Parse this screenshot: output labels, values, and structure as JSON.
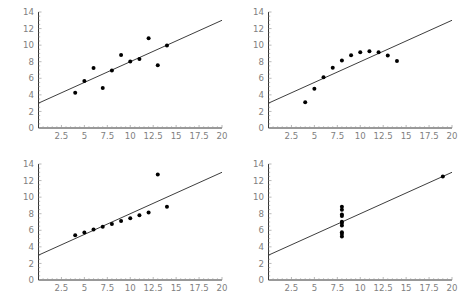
{
  "figure": {
    "title": "",
    "caption_fragment": ""
  },
  "chart_data": [
    {
      "type": "scatter",
      "title": "",
      "panel": "top-left",
      "xlabel": "",
      "ylabel": "",
      "xlim": [
        0,
        20
      ],
      "ylim": [
        0,
        14
      ],
      "xticks": [
        2.5,
        5,
        7.5,
        10,
        12.5,
        15,
        17.5,
        20
      ],
      "xtick_labels": [
        "2.5",
        "5",
        "7.5",
        "10",
        "12.5",
        "15",
        "17.5",
        "20"
      ],
      "yticks": [
        0,
        2,
        4,
        6,
        8,
        10,
        12,
        14
      ],
      "ytick_labels": [
        "0",
        "2",
        "4",
        "6",
        "8",
        "10",
        "12",
        "14"
      ],
      "grid": false,
      "legend": false,
      "x": [
        10,
        8,
        13,
        9,
        11,
        14,
        6,
        4,
        12,
        7,
        5
      ],
      "y": [
        8.04,
        6.95,
        7.58,
        8.81,
        8.33,
        9.96,
        7.24,
        4.26,
        10.84,
        4.82,
        5.68
      ],
      "fit_line": {
        "intercept": 3.0,
        "slope": 0.5,
        "x_start": 0,
        "x_end": 20,
        "y_start": 3.0,
        "y_end": 13.0
      }
    },
    {
      "type": "scatter",
      "title": "",
      "panel": "top-right",
      "xlabel": "",
      "ylabel": "",
      "xlim": [
        0,
        20
      ],
      "ylim": [
        0,
        14
      ],
      "xticks": [
        2.5,
        5,
        7.5,
        10,
        12.5,
        15,
        17.5,
        20
      ],
      "xtick_labels": [
        "2.5",
        "5",
        "7.5",
        "10",
        "12.5",
        "15",
        "17.5",
        "20"
      ],
      "yticks": [
        0,
        2,
        4,
        6,
        8,
        10,
        12,
        14
      ],
      "ytick_labels": [
        "0",
        "2",
        "4",
        "6",
        "8",
        "10",
        "12",
        "14"
      ],
      "grid": false,
      "legend": false,
      "x": [
        10,
        8,
        13,
        9,
        11,
        14,
        6,
        4,
        12,
        7,
        5
      ],
      "y": [
        9.14,
        8.14,
        8.74,
        8.77,
        9.26,
        8.1,
        6.13,
        3.1,
        9.13,
        7.26,
        4.74
      ],
      "fit_line": {
        "intercept": 3.0,
        "slope": 0.5,
        "x_start": 0,
        "x_end": 20,
        "y_start": 3.0,
        "y_end": 13.0
      }
    },
    {
      "type": "scatter",
      "title": "",
      "panel": "bottom-left",
      "xlabel": "",
      "ylabel": "",
      "xlim": [
        0,
        20
      ],
      "ylim": [
        0,
        14
      ],
      "xticks": [
        2.5,
        5,
        7.5,
        10,
        12.5,
        15,
        17.5,
        20
      ],
      "xtick_labels": [
        "2.5",
        "5",
        "7.5",
        "10",
        "12.5",
        "15",
        "17.5",
        "20"
      ],
      "yticks": [
        0,
        2,
        4,
        6,
        8,
        10,
        12,
        14
      ],
      "ytick_labels": [
        "0",
        "2",
        "4",
        "6",
        "8",
        "10",
        "12",
        "14"
      ],
      "grid": false,
      "legend": false,
      "x": [
        10,
        8,
        13,
        9,
        11,
        14,
        6,
        4,
        12,
        7,
        5
      ],
      "y": [
        7.46,
        6.77,
        12.74,
        7.11,
        7.81,
        8.84,
        6.08,
        5.39,
        8.15,
        6.42,
        5.73
      ],
      "fit_line": {
        "intercept": 3.0,
        "slope": 0.5,
        "x_start": 0,
        "x_end": 20,
        "y_start": 3.0,
        "y_end": 13.0
      }
    },
    {
      "type": "scatter",
      "title": "",
      "panel": "bottom-right",
      "xlabel": "",
      "ylabel": "",
      "xlim": [
        0,
        20
      ],
      "ylim": [
        0,
        14
      ],
      "xticks": [
        2.5,
        5,
        7.5,
        10,
        12.5,
        15,
        17.5,
        20
      ],
      "xtick_labels": [
        "2.5",
        "5",
        "7.5",
        "10",
        "12.5",
        "15",
        "17.5",
        "20"
      ],
      "yticks": [
        0,
        2,
        4,
        6,
        8,
        10,
        12,
        14
      ],
      "ytick_labels": [
        "0",
        "2",
        "4",
        "6",
        "8",
        "10",
        "12",
        "14"
      ],
      "grid": false,
      "legend": false,
      "x": [
        8,
        8,
        8,
        8,
        8,
        8,
        8,
        19,
        8,
        8,
        8
      ],
      "y": [
        6.58,
        5.76,
        7.71,
        8.84,
        8.47,
        7.04,
        5.25,
        12.5,
        5.56,
        7.91,
        6.89
      ],
      "fit_line": {
        "intercept": 3.0,
        "slope": 0.5,
        "x_start": 0,
        "x_end": 20,
        "y_start": 3.0,
        "y_end": 13.0
      }
    }
  ],
  "style": {
    "point_color": "#000000",
    "line_color": "#1a1a1a",
    "axis_color": "#000000",
    "tick_label_color": "#808080",
    "background": "#ffffff"
  }
}
